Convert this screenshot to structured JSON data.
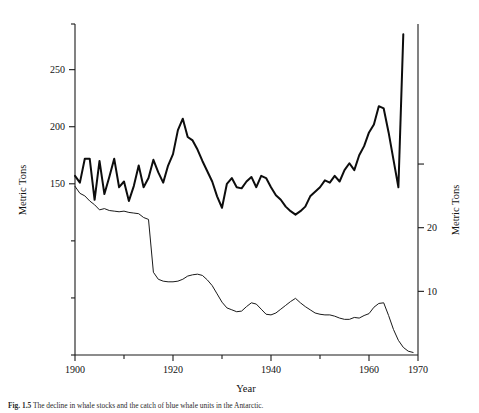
{
  "figure": {
    "caption_label": "Fig. 1.5",
    "caption_text": "The decline in whale stocks and the catch of blue whale units in the Antarctic.",
    "background_color": "#ffffff",
    "ink_color": "#111111"
  },
  "chart_data": {
    "type": "line",
    "title": "",
    "subtitle": "",
    "xlabel": "Year",
    "ylabel": "Metric Tons",
    "ylabel_right": "Metric Tons",
    "grid": false,
    "legend": "none",
    "xlim": [
      1900,
      1970
    ],
    "ylim": [
      0,
      290
    ],
    "ylim_right": [
      0,
      52
    ],
    "xticks_major": [
      1900,
      1920,
      1940,
      1960,
      1970
    ],
    "xticks_minor": [
      1910,
      1930,
      1950
    ],
    "xtick_labels": [
      "1900",
      "1920",
      "1940",
      "1960",
      "1970"
    ],
    "yticks_left": [
      150,
      200,
      250
    ],
    "ytick_labels_left": [
      "150",
      "200",
      "250"
    ],
    "yticks_left_minor": [
      0,
      50,
      100,
      290
    ],
    "yticks_right": [
      10,
      20
    ],
    "ytick_labels_right": [
      "10",
      "20"
    ],
    "yticks_right_minor": [
      30
    ],
    "series": [
      {
        "name": "Catch (thick line, left axis)",
        "axis": "left",
        "style": "thick",
        "x": [
          1900,
          1901,
          1902,
          1903,
          1904,
          1905,
          1906,
          1907,
          1908,
          1909,
          1910,
          1911,
          1912,
          1913,
          1914,
          1915,
          1916,
          1917,
          1918,
          1919,
          1920,
          1921,
          1922,
          1923,
          1924,
          1925,
          1926,
          1927,
          1928,
          1929,
          1930,
          1931,
          1932,
          1933,
          1934,
          1935,
          1936,
          1937,
          1938,
          1939,
          1940,
          1941,
          1942,
          1943,
          1944,
          1945,
          1946,
          1947,
          1948,
          1949,
          1950,
          1951,
          1952,
          1953,
          1954,
          1955,
          1956,
          1957,
          1958,
          1959,
          1960,
          1961,
          1962,
          1963,
          1964,
          1965,
          1966,
          1967
        ],
        "values": [
          157,
          151,
          172,
          172,
          136,
          170,
          141,
          156,
          172,
          147,
          152,
          135,
          148,
          166,
          147,
          155,
          171,
          160,
          151,
          166,
          176,
          197,
          207,
          191,
          188,
          180,
          170,
          161,
          152,
          139,
          129,
          150,
          155,
          147,
          146,
          152,
          156,
          147,
          157,
          155,
          147,
          140,
          136,
          130,
          126,
          123,
          126,
          130,
          139,
          143,
          147,
          153,
          151,
          157,
          152,
          162,
          168,
          162,
          175,
          183,
          195,
          202,
          218,
          216,
          195,
          171,
          147,
          281
        ]
      },
      {
        "name": "Stock (thin line, right axis)",
        "axis": "right",
        "style": "thin",
        "x": [
          1900,
          1901,
          1902,
          1903,
          1904,
          1905,
          1906,
          1907,
          1908,
          1909,
          1910,
          1911,
          1912,
          1913,
          1914,
          1915,
          1916,
          1917,
          1918,
          1919,
          1920,
          1921,
          1922,
          1923,
          1924,
          1925,
          1926,
          1927,
          1928,
          1929,
          1930,
          1931,
          1932,
          1933,
          1934,
          1935,
          1936,
          1937,
          1938,
          1939,
          1940,
          1941,
          1942,
          1943,
          1944,
          1945,
          1946,
          1947,
          1948,
          1949,
          1950,
          1951,
          1952,
          1953,
          1954,
          1955,
          1956,
          1957,
          1958,
          1959,
          1960,
          1961,
          1962,
          1963,
          1964,
          1965,
          1966,
          1967,
          1968,
          1969
        ],
        "values": [
          26.5,
          25.4,
          25.0,
          24.2,
          23.6,
          22.8,
          23.0,
          22.7,
          22.6,
          22.5,
          22.6,
          22.4,
          22.3,
          22.2,
          21.6,
          21.3,
          13.0,
          11.9,
          11.6,
          11.5,
          11.5,
          11.6,
          11.9,
          12.4,
          12.6,
          12.7,
          12.5,
          11.8,
          10.9,
          9.6,
          8.3,
          7.4,
          7.1,
          6.8,
          6.9,
          7.6,
          8.2,
          8.0,
          7.2,
          6.4,
          6.3,
          6.6,
          7.2,
          7.8,
          8.4,
          8.9,
          8.2,
          7.6,
          7.1,
          6.6,
          6.4,
          6.3,
          6.3,
          6.1,
          5.8,
          5.6,
          5.6,
          5.9,
          5.8,
          6.2,
          6.5,
          7.5,
          8.1,
          8.2,
          6.2,
          4.0,
          2.3,
          1.2,
          0.6,
          0.4
        ]
      }
    ]
  },
  "axis_labels": {
    "x_title": "Year",
    "y_left_title": "Metric Tons",
    "y_right_title": "Metric Tons"
  }
}
